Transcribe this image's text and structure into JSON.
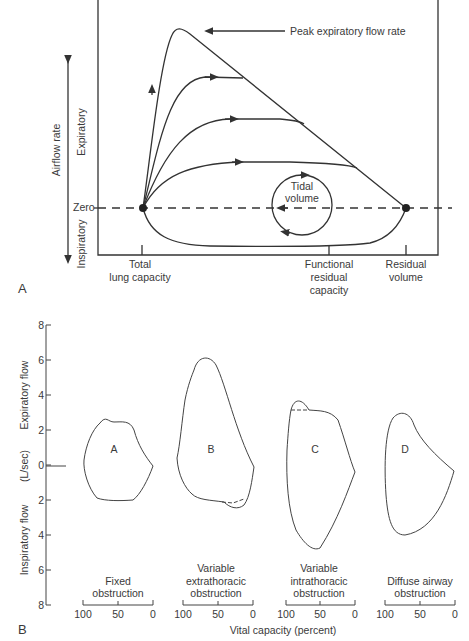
{
  "panel_a": {
    "label": "A",
    "axis_title": "Airflow rate",
    "y_upper": "Expiratory",
    "y_lower": "Inspiratory",
    "zero": "Zero",
    "peak": "Peak expiratory flow rate",
    "tidal_1": "Tidal",
    "tidal_2": "volume",
    "x_labels": {
      "tlc_1": "Total",
      "tlc_2": "lung capacity",
      "frc_1": "Functional",
      "frc_2": "residual",
      "frc_3": "capacity",
      "rv_1": "Residual",
      "rv_2": "volume"
    }
  },
  "panel_b": {
    "label": "B",
    "y_ticks": [
      "8",
      "6",
      "4",
      "2",
      "0",
      "2",
      "4",
      "6",
      "8"
    ],
    "y_title_upper": "Expiratory flow",
    "y_title_mid": "(L/sec)",
    "y_title_lower": "Inspiratory flow",
    "x_title": "Vital capacity (percent)",
    "x_ticks": [
      "100",
      "50",
      "0"
    ],
    "loops": [
      {
        "letter": "A",
        "caption": [
          "Fixed",
          "obstruction"
        ]
      },
      {
        "letter": "B",
        "caption": [
          "Variable",
          "extrathoracic",
          "obstruction"
        ]
      },
      {
        "letter": "C",
        "caption": [
          "Variable",
          "intrathoracic",
          "obstruction"
        ]
      },
      {
        "letter": "D",
        "caption": [
          "Diffuse airway",
          "obstruction"
        ]
      }
    ]
  }
}
